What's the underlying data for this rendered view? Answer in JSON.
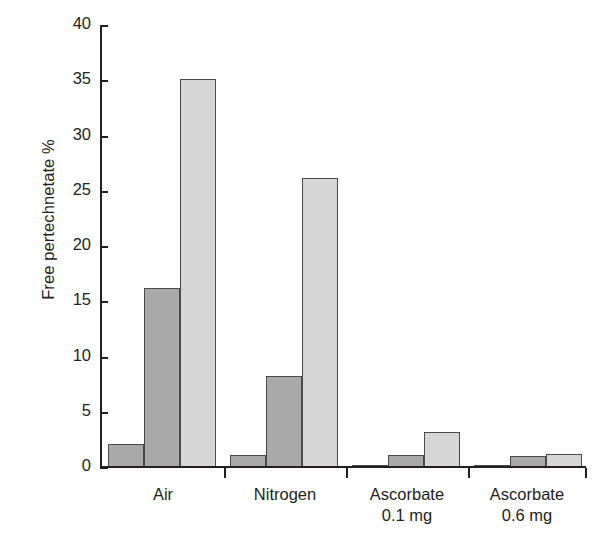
{
  "chart_data": {
    "type": "bar",
    "title": "",
    "xlabel": "",
    "ylabel": "Free pertechnetate %",
    "ylim": [
      0,
      40
    ],
    "yticks": [
      0,
      5,
      10,
      15,
      20,
      25,
      30,
      35,
      40
    ],
    "ytick_labels": [
      "0",
      "5",
      "10",
      "15",
      "20",
      "25",
      "30",
      "35",
      "40"
    ],
    "grid": false,
    "legend": "none",
    "categories": [
      "Air",
      "Nitrogen",
      "Ascorbate 0.1 mg",
      "Ascorbate 0.6 mg"
    ],
    "category_lines": [
      [
        "Air"
      ],
      [
        "Nitrogen"
      ],
      [
        "Ascorbate",
        "0.1 mg"
      ],
      [
        "Ascorbate",
        "0.6 mg"
      ]
    ],
    "series": [
      {
        "name": "Series 1",
        "color": "#a9a9a9",
        "values": [
          2.1,
          1.1,
          0.2,
          0.2
        ]
      },
      {
        "name": "Series 2",
        "color": "#a9a9a9",
        "values": [
          16.2,
          8.2,
          1.1,
          1.0
        ]
      },
      {
        "name": "Series 3",
        "color": "#d6d6d6",
        "values": [
          35.1,
          26.2,
          3.2,
          1.2
        ]
      }
    ]
  },
  "colors": {
    "axis": "#231f20",
    "bar_dark": "#a9a9a9",
    "bar_light": "#d6d6d6",
    "bar_outline": "#4a4a4a",
    "background": "#ffffff"
  }
}
